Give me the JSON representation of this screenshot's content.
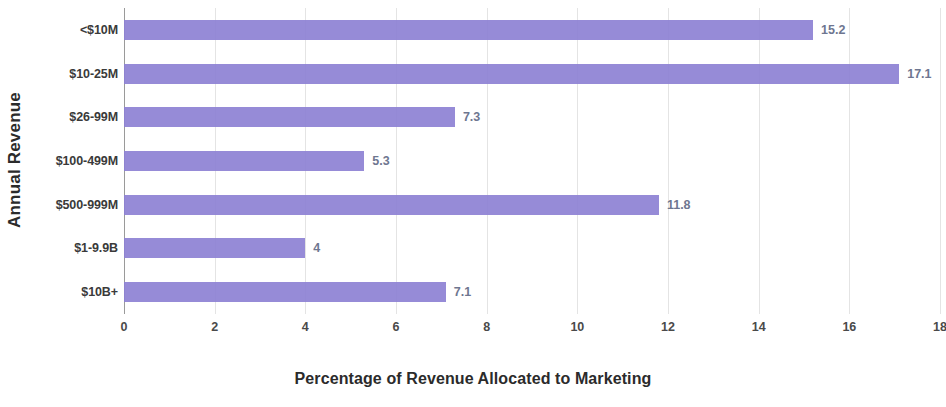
{
  "chart_data": {
    "type": "bar",
    "orientation": "horizontal",
    "title": "",
    "xlabel": "Percentage of Revenue Allocated to Marketing",
    "ylabel": "Annual Revenue",
    "categories": [
      "<$10M",
      "$10-25M",
      "$26-99M",
      "$100-499M",
      "$500-999M",
      "$1-9.9B",
      "$10B+"
    ],
    "values": [
      15.2,
      17.1,
      7.3,
      5.3,
      11.8,
      4,
      7.1
    ],
    "value_labels": [
      "15.2",
      "17.1",
      "7.3",
      "5.3",
      "11.8",
      "4",
      "7.1"
    ],
    "xlim": [
      0,
      18
    ],
    "xticks": [
      0,
      2,
      4,
      6,
      8,
      10,
      12,
      14,
      16,
      18
    ],
    "xtick_labels": [
      "0",
      "2",
      "4",
      "6",
      "8",
      "10",
      "12",
      "14",
      "16",
      "18"
    ],
    "grid": true,
    "grid_axis": "x",
    "legend": null,
    "bar_color": "#8d81d4",
    "value_label_color": "#6e7690",
    "gridline_color": "#e4e4e4",
    "axis_color": "#9a9a9a",
    "text_color": "#2b2b2b"
  }
}
